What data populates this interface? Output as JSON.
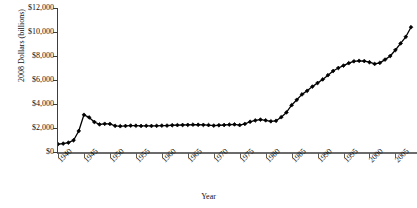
{
  "chart_data": {
    "type": "line",
    "title": "",
    "xlabel": "Year",
    "ylabel": "2008 Dollars (billions)",
    "xlim": [
      1940,
      2008
    ],
    "ylim": [
      0,
      12000
    ],
    "grid": false,
    "legend": null,
    "marker": "diamond",
    "line_color": "#000000",
    "marker_color": "#000000",
    "y_ticks": [
      0,
      2000,
      4000,
      6000,
      8000,
      10000,
      12000
    ],
    "y_tick_labels": [
      "$0",
      "$2,000",
      "$4,000",
      "$6,000",
      "$8,000",
      "$10,000",
      "$12,000"
    ],
    "x_ticks": [
      1940,
      1945,
      1950,
      1955,
      1960,
      1965,
      1970,
      1975,
      1980,
      1985,
      1990,
      1995,
      2000,
      2005
    ],
    "x_tick_labels": [
      "1940",
      "1945",
      "1950",
      "1955",
      "1960",
      "1965",
      "1970",
      "1975",
      "1980",
      "1985",
      "1990",
      "1995",
      "2000",
      "2005"
    ],
    "x": [
      1940,
      1941,
      1942,
      1943,
      1944,
      1945,
      1946,
      1947,
      1948,
      1949,
      1950,
      1951,
      1952,
      1953,
      1954,
      1955,
      1956,
      1957,
      1958,
      1959,
      1960,
      1961,
      1962,
      1963,
      1964,
      1965,
      1966,
      1967,
      1968,
      1969,
      1970,
      1971,
      1972,
      1973,
      1974,
      1975,
      1976,
      1977,
      1978,
      1979,
      1980,
      1981,
      1982,
      1983,
      1984,
      1985,
      1986,
      1987,
      1988,
      1989,
      1990,
      1991,
      1992,
      1993,
      1994,
      1995,
      1996,
      1997,
      1998,
      1999,
      2000,
      2001,
      2002,
      2003,
      2004,
      2005,
      2006,
      2007,
      2008
    ],
    "values": [
      650,
      700,
      780,
      980,
      1750,
      3100,
      2880,
      2500,
      2300,
      2350,
      2340,
      2180,
      2150,
      2170,
      2200,
      2190,
      2170,
      2180,
      2170,
      2180,
      2200,
      2200,
      2230,
      2240,
      2250,
      2260,
      2280,
      2270,
      2260,
      2240,
      2200,
      2230,
      2250,
      2280,
      2300,
      2240,
      2340,
      2520,
      2630,
      2700,
      2640,
      2560,
      2600,
      2900,
      3300,
      3900,
      4350,
      4800,
      5100,
      5450,
      5750,
      6050,
      6400,
      6750,
      7000,
      7200,
      7400,
      7560,
      7600,
      7580,
      7480,
      7340,
      7430,
      7700,
      8000,
      8500,
      9050,
      9600,
      10400
    ],
    "series_name": "Value"
  },
  "axis": {
    "y_title": "2008 Dollars (billions)",
    "x_title": "Year"
  }
}
